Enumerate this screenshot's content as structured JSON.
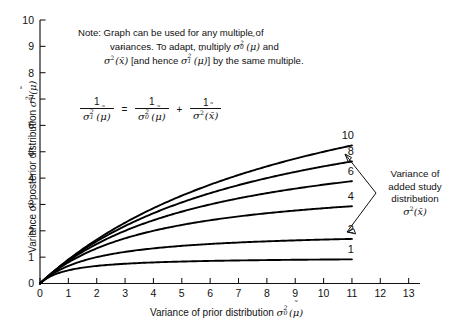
{
  "chart_data": {
    "type": "line",
    "title": "",
    "xlabel": "Variance of prior distribution σ²₀(μ̃)",
    "ylabel": "Variance of posterior distribution σ²₁(μ̃)",
    "xlim": [
      0,
      13.4
    ],
    "ylim": [
      0,
      10
    ],
    "xticks": [
      0,
      1,
      2,
      3,
      4,
      5,
      6,
      7,
      8,
      9,
      10,
      11,
      12,
      13
    ],
    "yticks": [
      0,
      1,
      2,
      3,
      4,
      5,
      6,
      7,
      8,
      9,
      10
    ],
    "grid": false,
    "legend_position": "inline-curve-labels",
    "x": [
      0,
      0.5,
      1,
      1.5,
      2,
      2.5,
      3,
      3.5,
      4,
      4.5,
      5,
      5.5,
      6,
      6.5,
      7,
      7.5,
      8,
      8.5,
      9,
      9.5,
      10,
      10.5,
      11
    ],
    "series": [
      {
        "name": "10",
        "label": "10",
        "added_study_variance": 10,
        "values": [
          0,
          0.476,
          0.909,
          1.304,
          1.667,
          2.0,
          2.308,
          2.593,
          2.857,
          3.103,
          3.333,
          3.548,
          3.75,
          3.939,
          4.118,
          4.286,
          4.444,
          4.595,
          4.737,
          4.872,
          5.0,
          5.122,
          5.238
        ]
      },
      {
        "name": "8",
        "label": "8",
        "added_study_variance": 8,
        "values": [
          0,
          0.471,
          0.889,
          1.263,
          1.6,
          1.905,
          2.182,
          2.435,
          2.667,
          2.88,
          3.077,
          3.259,
          3.429,
          3.586,
          3.733,
          3.871,
          4.0,
          4.121,
          4.235,
          4.343,
          4.444,
          4.541,
          4.632
        ]
      },
      {
        "name": "6",
        "label": "6",
        "added_study_variance": 6,
        "values": [
          0,
          0.462,
          0.857,
          1.2,
          1.5,
          1.765,
          2.0,
          2.211,
          2.4,
          2.571,
          2.727,
          2.87,
          3.0,
          3.12,
          3.231,
          3.333,
          3.429,
          3.517,
          3.6,
          3.677,
          3.75,
          3.818,
          3.882
        ]
      },
      {
        "name": "4",
        "label": "4",
        "added_study_variance": 4,
        "values": [
          0,
          0.444,
          0.8,
          1.091,
          1.333,
          1.538,
          1.714,
          1.867,
          2.0,
          2.118,
          2.222,
          2.316,
          2.4,
          2.476,
          2.545,
          2.609,
          2.667,
          2.72,
          2.769,
          2.815,
          2.857,
          2.897,
          2.933
        ]
      },
      {
        "name": "2",
        "label": "2",
        "added_study_variance": 2,
        "values": [
          0,
          0.4,
          0.667,
          0.857,
          1.0,
          1.111,
          1.2,
          1.273,
          1.333,
          1.385,
          1.429,
          1.467,
          1.5,
          1.529,
          1.556,
          1.579,
          1.6,
          1.619,
          1.636,
          1.652,
          1.667,
          1.68,
          1.692
        ]
      },
      {
        "name": "1",
        "label": "1",
        "added_study_variance": 1,
        "values": [
          0,
          0.333,
          0.5,
          0.6,
          0.667,
          0.714,
          0.75,
          0.778,
          0.8,
          0.818,
          0.833,
          0.846,
          0.857,
          0.867,
          0.875,
          0.882,
          0.889,
          0.895,
          0.9,
          0.905,
          0.909,
          0.913,
          0.917
        ]
      }
    ],
    "annotations": {
      "note": "Note: Graph can be used for any multiple of variances. To adapt, multiply σ²₀(μ̃) and σ²(x̄̃) [and hence σ²₁(μ̃)] by the same multiple.",
      "formula": "1/σ²₁(μ̃) = 1/σ²₀(μ̃) + 1/σ²(x̄̃)",
      "arrow_label": "Variance of added study distribution σ²(x̄̃)"
    },
    "colors": {
      "curve": "#000000",
      "axis": "#111111",
      "background": "#ffffff",
      "text": "#111111"
    }
  },
  "note": {
    "line1": "Note: Graph can be used for any multiple of",
    "line2_pre": "variances. To adapt, multiply ",
    "line2_post": " and",
    "line3_mid": " [and hence ",
    "line3_post": "] by the same multiple."
  },
  "right_annotation": {
    "line1": "Variance of",
    "line2": "added study",
    "line3": "distribution"
  },
  "axis": {
    "x_title_text": "Variance of prior distribution",
    "y_title_text": "Variance of posterior distribution"
  }
}
